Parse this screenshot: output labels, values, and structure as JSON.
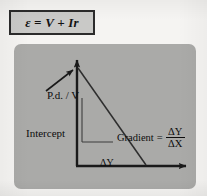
{
  "equation": {
    "text": "ε = V + Ir"
  },
  "graph": {
    "y_axis_label": "P.d. / V",
    "x_axis_label": "Current / A",
    "intercept_label": "Intercept",
    "gradient": {
      "word": "Gradient",
      "equals": "=",
      "numerator": "ΔY",
      "denominator": "ΔX"
    },
    "delta_y_label": "ΔY",
    "delta_x_label": "ΔX"
  },
  "colors": {
    "page_background": "#f5f4f2",
    "panel_background": "#aaaaa8",
    "equation_box_fill": "#c9c9c7",
    "ink": "#0d0d0d",
    "line": "#3a3a3a"
  }
}
